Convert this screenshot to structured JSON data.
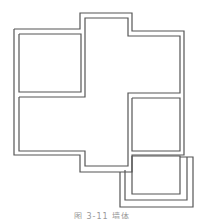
{
  "diagram": {
    "type": "floor-plan-walls",
    "stroke_color": "#555555",
    "background": "#ffffff",
    "walls": {
      "outer": "14,29 80,29 80,13 132,13 132,31 184,31 184,155 132,155 132,172 80,172 80,155 14,155 14,29",
      "inner_top_left_room": "19,34 81,34 81,92 19,92 19,34",
      "inner_main": "19,97 85,97 85,18 128,18 128,36 180,36 180,93 128,93 128,166 85,166 85,151 19,151 19,97",
      "inner_right_room": "132,98 180,98 180,151 132,151 132,98",
      "balcony_inner": "132,156 180,156 180,194 132,194 132,156",
      "balcony_mid": "125,170 125,200 187,200 187,157",
      "balcony_outer": "120,172 120,207 193,207 193,157 180,157"
    }
  },
  "caption": "图 3-11  墙体"
}
